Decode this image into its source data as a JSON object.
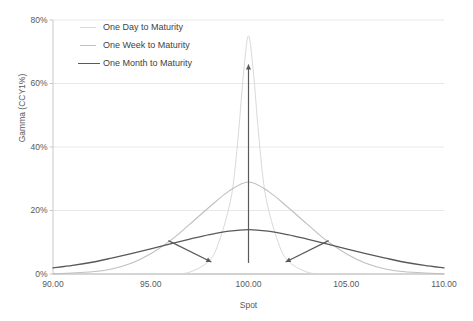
{
  "chart_data": {
    "type": "line",
    "title": "",
    "xlabel": "Spot",
    "ylabel": "Gamma (CCY1%)",
    "xlim": [
      90,
      110
    ],
    "ylim": [
      0,
      80
    ],
    "xticks": [
      "90.00",
      "95.00",
      "100.00",
      "105.00",
      "110.00"
    ],
    "xtick_values": [
      90,
      95,
      100,
      105,
      110
    ],
    "yticks": [
      "0%",
      "20%",
      "40%",
      "60%",
      "80%"
    ],
    "ytick_values": [
      0,
      20,
      40,
      60,
      80
    ],
    "grid": "horizontal",
    "legend_position": "top-left-inside",
    "series": [
      {
        "name": "One Day to Maturity",
        "color": "#d9d9d9",
        "width": 1.0,
        "peak_x": 100,
        "peak_y": 75,
        "sigma": 0.95,
        "x": [
          90,
          92,
          94,
          96,
          97,
          98,
          98.5,
          99,
          99.25,
          99.5,
          99.75,
          100,
          100.25,
          100.5,
          100.75,
          101,
          101.5,
          102,
          103,
          104,
          106,
          108,
          110
        ],
        "values": [
          0,
          0,
          0,
          0.1,
          0.6,
          4.2,
          10.3,
          20.9,
          29.8,
          45.2,
          63.5,
          75.0,
          63.5,
          45.2,
          29.8,
          20.9,
          10.3,
          4.2,
          0.6,
          0.1,
          0,
          0,
          0
        ]
      },
      {
        "name": "One Week to Maturity",
        "color": "#bfbfbf",
        "width": 1.1,
        "peak_x": 100,
        "peak_y": 29,
        "sigma": 2.45,
        "x": [
          90,
          92,
          93,
          94,
          95,
          96,
          97,
          98,
          99,
          100,
          101,
          102,
          103,
          104,
          105,
          106,
          107,
          108,
          110
        ],
        "values": [
          0.05,
          0.7,
          1.6,
          3.4,
          6.4,
          10.5,
          15.7,
          21.1,
          26.1,
          29.0,
          26.1,
          21.1,
          15.7,
          10.5,
          6.4,
          3.4,
          1.6,
          0.7,
          0.05
        ]
      },
      {
        "name": "One Month to Maturity",
        "color": "#595959",
        "width": 1.3,
        "peak_x": 100,
        "peak_y": 14,
        "sigma": 5.1,
        "x": [
          90,
          91,
          92,
          93,
          94,
          95,
          96,
          97,
          98,
          99,
          100,
          101,
          102,
          103,
          104,
          105,
          106,
          107,
          108,
          109,
          110
        ],
        "values": [
          1.9,
          2.7,
          3.7,
          5.0,
          6.4,
          7.9,
          9.5,
          11.0,
          12.4,
          13.5,
          14.0,
          13.5,
          12.4,
          11.0,
          9.5,
          7.9,
          6.4,
          5.0,
          3.7,
          2.7,
          1.9
        ]
      }
    ],
    "annotations": [
      {
        "name": "vertical-peak-arrow",
        "kind": "arrow",
        "from": {
          "x": 100,
          "y": 3.5
        },
        "to": {
          "x": 100,
          "y": 66
        },
        "color": "#595959"
      },
      {
        "name": "left-spread-arrow",
        "kind": "arrow",
        "from": {
          "x": 95.9,
          "y": 10.5
        },
        "to": {
          "x": 98.1,
          "y": 3.8
        },
        "color": "#595959"
      },
      {
        "name": "right-spread-arrow",
        "kind": "arrow",
        "from": {
          "x": 104.1,
          "y": 10.5
        },
        "to": {
          "x": 101.9,
          "y": 3.8
        },
        "color": "#595959"
      }
    ]
  },
  "legend": {
    "items": [
      {
        "label": "One Day to Maturity",
        "color": "#d9d9d9",
        "width": 1.0
      },
      {
        "label": "One Week to Maturity",
        "color": "#bfbfbf",
        "width": 1.1
      },
      {
        "label": "One Month to Maturity",
        "color": "#595959",
        "width": 1.8
      }
    ]
  },
  "style": {
    "background": "#ffffff",
    "grid_color": "#e8e8e8",
    "axis_color": "#c9c9c9",
    "tick_text_color": "#595959"
  }
}
